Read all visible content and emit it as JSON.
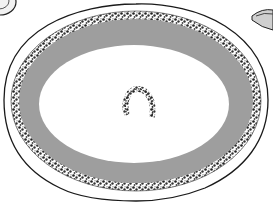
{
  "image": {
    "subject": "engraved illustration of an oval serving platter with floral garland border",
    "width": 273,
    "height": 205,
    "colors": {
      "background": "#ffffff",
      "ink": "#1a1a1a",
      "rim_shading": "#9a9a9a",
      "garland": "#2b2b2b"
    },
    "elements": [
      {
        "name": "platter",
        "shape": "scalloped-oval"
      },
      {
        "name": "floral-garland-border",
        "shape": "oval-wreath"
      },
      {
        "name": "shaded-inner-rim",
        "shape": "oval-band"
      },
      {
        "name": "center-floral-motif",
        "shape": "horseshoe-wreath"
      },
      {
        "name": "partial-dish-top-left",
        "shape": "cropped-oval"
      },
      {
        "name": "partial-dish-top-right",
        "shape": "cropped-oval"
      }
    ]
  }
}
